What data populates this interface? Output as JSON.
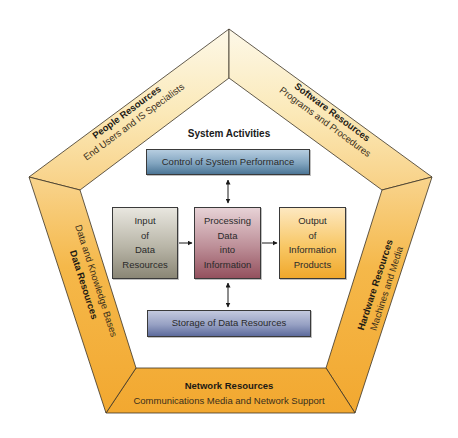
{
  "diagram": {
    "center_title": "System Activities",
    "activities": {
      "control": "Control of System Performance",
      "input": "Input\nof\nData\nResources",
      "processing": "Processing\nData\ninto\nInformation",
      "output": "Output\nof\nInformation\nProducts",
      "storage": "Storage of Data Resources"
    },
    "resources": {
      "people": {
        "title": "People Resources",
        "subtitle": "End Users and IS Specialists"
      },
      "software": {
        "title": "Software Resources",
        "subtitle": "Programs and Procedures"
      },
      "data": {
        "title": "Data Resources",
        "subtitle": "Data and Knowledge Bases"
      },
      "hardware": {
        "title": "Hardware Resources",
        "subtitle": "Machines and Media"
      },
      "network": {
        "title": "Network Resources",
        "subtitle": "Communications Media and Network Support"
      }
    },
    "colors": {
      "band_top": "#fdf6e2",
      "band_bottom": "#f4ad36",
      "control_box": "#4c7696",
      "storage_box": "#5d6b9c",
      "input_box": "#8a8675",
      "processing_box": "#94515e",
      "output_box": "#f0a82c"
    }
  }
}
